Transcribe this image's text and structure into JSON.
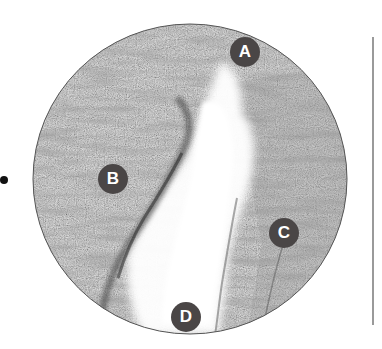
{
  "figure": {
    "labels": [
      {
        "id": "A",
        "text": "A",
        "x": 245,
        "y": 52
      },
      {
        "id": "B",
        "text": "B",
        "x": 113,
        "y": 179
      },
      {
        "id": "C",
        "text": "C",
        "x": 284,
        "y": 233
      },
      {
        "id": "D",
        "text": "D",
        "x": 186,
        "y": 317
      }
    ],
    "marker_color": "#4a4646",
    "marker_text_color": "#ffffff"
  }
}
